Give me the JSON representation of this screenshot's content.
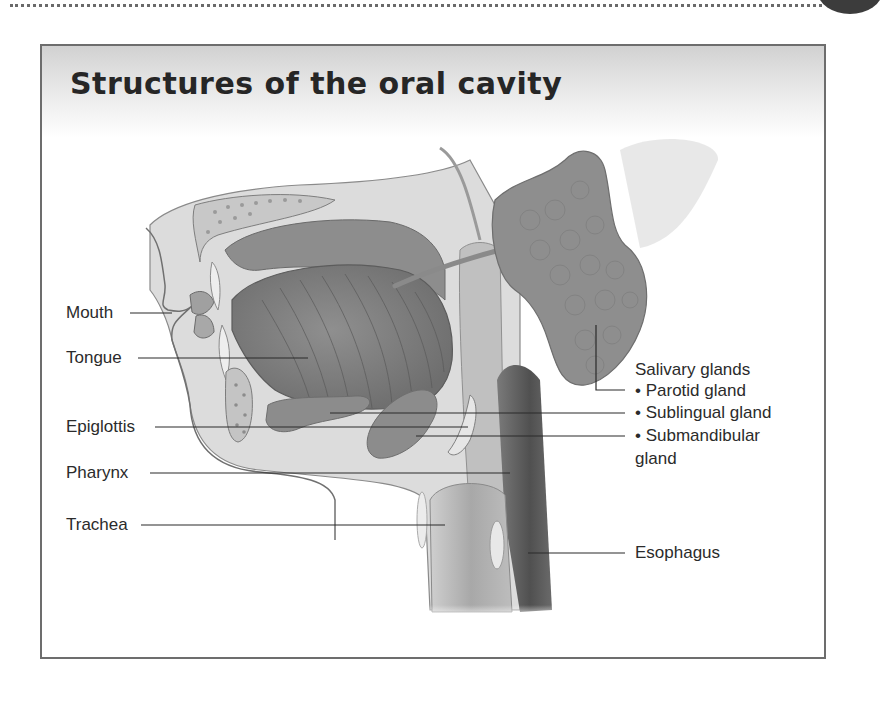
{
  "page": {
    "decorations": [
      "dotted-rule",
      "corner-dot"
    ]
  },
  "figure": {
    "title": "Structures of the oral cavity",
    "colors": {
      "frame": "#6d6d6d",
      "header_gradient_top": "#cfcfcf",
      "gland": "#8c8c8c",
      "esophagus": "#5e5e5e",
      "tissue": "#d9d9d9",
      "leader_line": "#2a2a2a"
    },
    "labels_left": [
      {
        "id": "mouth",
        "text": "Mouth"
      },
      {
        "id": "tongue",
        "text": "Tongue"
      },
      {
        "id": "epiglottis",
        "text": "Epiglottis"
      },
      {
        "id": "pharynx",
        "text": "Pharynx"
      },
      {
        "id": "trachea",
        "text": "Trachea"
      }
    ],
    "salivary": {
      "heading": "Salivary glands",
      "items": [
        {
          "id": "parotid",
          "text": "• Parotid gland"
        },
        {
          "id": "sublingual",
          "text": "• Sublingual gland"
        },
        {
          "id": "submandibular",
          "text": "• Submandibular"
        },
        {
          "id": "submandibular-cont",
          "text": "gland"
        }
      ]
    },
    "labels_right": [
      {
        "id": "esophagus",
        "text": "Esophagus"
      }
    ]
  }
}
